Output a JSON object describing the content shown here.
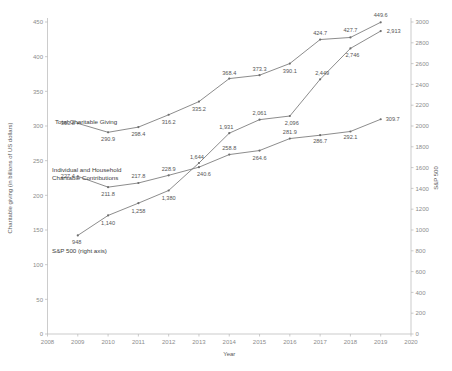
{
  "chart_data": {
    "type": "line",
    "title": "",
    "xlabel": "Year",
    "ylabel": "Charitable giving (in billions of US dollars)",
    "y2label": "S&P 500",
    "grid": false,
    "legend_position": "inline-annotations",
    "x": [
      2009,
      2010,
      2011,
      2012,
      2013,
      2014,
      2015,
      2016,
      2017,
      2018,
      2019
    ],
    "xlim": [
      2008,
      2020
    ],
    "xticks": [
      "2008",
      "2009",
      "2010",
      "2011",
      "2012",
      "2013",
      "2014",
      "2015",
      "2016",
      "2017",
      "2018",
      "2019",
      "2020"
    ],
    "ylim": [
      0,
      450
    ],
    "yticks": [
      "0",
      "50",
      "100",
      "150",
      "200",
      "250",
      "300",
      "350",
      "400",
      "450"
    ],
    "y2lim": [
      0,
      3000
    ],
    "y2ticks": [
      "0",
      "200",
      "400",
      "600",
      "800",
      "1000",
      "1200",
      "1400",
      "1600",
      "1800",
      "2000",
      "2200",
      "2400",
      "2600",
      "2800",
      "3000"
    ],
    "series": [
      {
        "name": "Total Charitable Giving",
        "axis": "left",
        "label_text": "Total Charitable Giving",
        "values": [
          303.8,
          290.9,
          298.4,
          316.2,
          335.2,
          368.4,
          373.3,
          390.1,
          424.7,
          427.7,
          449.6
        ],
        "labels": [
          "303.8",
          "290.9",
          "298.4",
          "316.2",
          "335.2",
          "368.4",
          "373.3",
          "390.1",
          "424.7",
          "427.7",
          "449.6"
        ]
      },
      {
        "name": "Individual and Household Charitable Contributions",
        "axis": "left",
        "label_text": "Individual and Household\nCharitable Contributions",
        "label_line1": "Individual and Household",
        "label_line2": "Charitable Contributions",
        "values": [
          227.4,
          211.8,
          217.8,
          228.9,
          240.6,
          258.8,
          264.6,
          281.9,
          286.7,
          292.1,
          309.7
        ],
        "labels": [
          "227.4",
          "211.8",
          "217.8",
          "228.9",
          "240.6",
          "258.8",
          "264.6",
          "281.9",
          "286.7",
          "292.1",
          "309.7"
        ]
      },
      {
        "name": "S&P 500 (right axis)",
        "axis": "right",
        "label_text": "S&P 500 (right axis)",
        "values": [
          948,
          1140,
          1258,
          1380,
          1644,
          1931,
          2061,
          2096,
          2449,
          2746,
          2913
        ],
        "labels": [
          "948",
          "1,140",
          "1,258",
          "1,380",
          "1,644",
          "1,931",
          "2,061",
          "2,096",
          "2,449",
          "2,746",
          "2,913"
        ]
      }
    ]
  },
  "colors": {
    "line": "#6e6e6e",
    "axis": "#b6b6b6",
    "tick_text": "#8c8c8c",
    "label_text": "#555555",
    "background": "#ffffff"
  }
}
